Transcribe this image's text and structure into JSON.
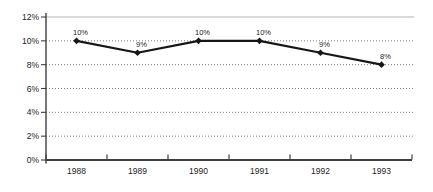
{
  "chart_data": {
    "type": "line",
    "categories": [
      "1988",
      "1989",
      "1990",
      "1991",
      "1992",
      "1993"
    ],
    "series": [
      {
        "name": "percentage-series",
        "values": [
          10,
          9,
          10,
          10,
          9,
          8
        ]
      }
    ],
    "point_labels": [
      "10%",
      "9%",
      "10%",
      "10%",
      "9%",
      "8%"
    ],
    "y_tick_labels": [
      "0%",
      "2%",
      "4%",
      "6%",
      "8%",
      "10%",
      "12%"
    ],
    "ylim": [
      0,
      12
    ],
    "y_step": 2,
    "title": "",
    "xlabel": "",
    "ylabel": "",
    "legend": "none",
    "grid": "horizontal-dotted",
    "marker": "diamond",
    "colors": {
      "line": "#161616",
      "marker": "#161616",
      "axis": "#3f3f3f",
      "gridline_dotted": "#7d7d7d",
      "gridline_top_solid": "#b3b3b3",
      "label_text": "#1c1c1c",
      "background": "#ffffff"
    }
  }
}
